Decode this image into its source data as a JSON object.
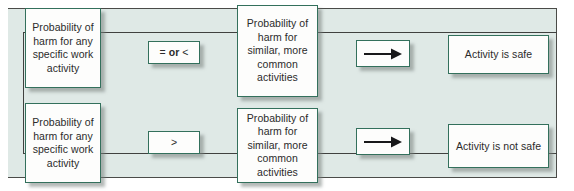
{
  "diagram": {
    "background_color": "#dfe9e6",
    "box_border_color": "#33705c",
    "box_fill_color": "#fdfdfc",
    "connector_color": "#40413f",
    "rows": [
      {
        "id": "row-safe",
        "source_box": "Probability of\nharm for any\nspecific work\nactivity",
        "operator": {
          "prefix": "= ",
          "emphasis": "or",
          "suffix": " <"
        },
        "operator_plain": "= or <",
        "comparison_box": "Probability of\nharm for\nsimilar, more\ncommon\nactivities",
        "arrow": "right-arrow",
        "outcome": "Activity is safe"
      },
      {
        "id": "row-not-safe",
        "source_box": "Probability of\nharm for any\nspecific work\nactivity",
        "operator": {
          "prefix": "",
          "emphasis": "",
          "suffix": ">"
        },
        "operator_plain": ">",
        "comparison_box": "Probability of\nharm for\nsimilar, more\ncommon\nactivities",
        "arrow": "right-arrow",
        "outcome": "Activity is not safe"
      }
    ]
  }
}
